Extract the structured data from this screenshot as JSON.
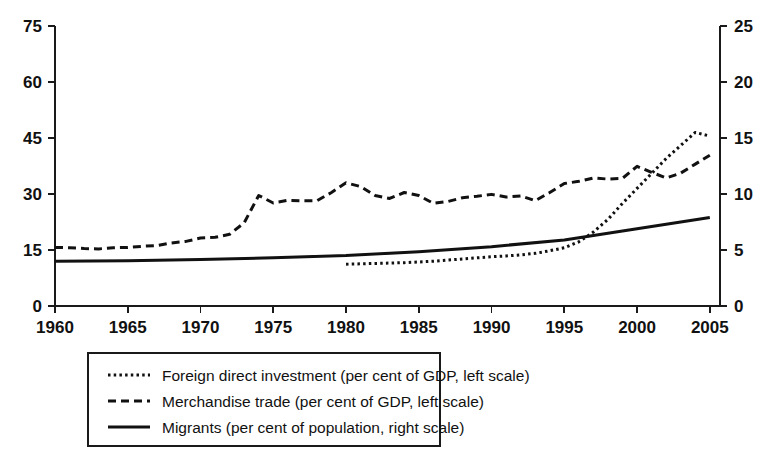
{
  "chart_data": {
    "type": "line",
    "title": "",
    "subtitle": "",
    "xlabel": "",
    "ylabel": "",
    "xlim": [
      1960,
      2005.7
    ],
    "ylim": [
      0,
      75
    ],
    "y2lim": [
      0,
      25
    ],
    "xticks": [
      1960,
      1965,
      1970,
      1975,
      1980,
      1985,
      1990,
      1995,
      2000,
      2005
    ],
    "xticklabels": [
      "1960",
      "1965",
      "1970",
      "1975",
      "1980",
      "1985",
      "1990",
      "1995",
      "2000",
      "2005"
    ],
    "yticks": [
      0,
      15,
      30,
      45,
      60,
      75
    ],
    "yticklabels": [
      "0",
      "15",
      "30",
      "45",
      "60",
      "75"
    ],
    "y2ticks": [
      0,
      5,
      10,
      15,
      20,
      25
    ],
    "y2ticklabels": [
      "0",
      "5",
      "10",
      "15",
      "20",
      "25"
    ],
    "grid": false,
    "legend_position": "below-center",
    "series": [
      {
        "name": "Foreign direct investment (per cent of GDP, left scale)",
        "style": "dotted",
        "axis": "left",
        "color": "#111111",
        "x": [
          1980,
          1981,
          1982,
          1983,
          1984,
          1985,
          1986,
          1987,
          1988,
          1989,
          1990,
          1991,
          1992,
          1993,
          1994,
          1995,
          1996,
          1997,
          1998,
          1999,
          2000,
          2001,
          2002,
          2003,
          2004,
          2005
        ],
        "values": [
          11.2,
          11.3,
          11.4,
          11.5,
          11.6,
          11.8,
          12.0,
          12.3,
          12.6,
          12.9,
          13.2,
          13.4,
          13.7,
          14.1,
          14.8,
          15.6,
          17.2,
          19.8,
          23.2,
          27.5,
          31.5,
          35.5,
          39.5,
          43.0,
          46.5,
          45.5
        ]
      },
      {
        "name": "Merchandise trade (per cent of GDP, left scale)",
        "style": "dashed",
        "axis": "left",
        "color": "#111111",
        "x": [
          1960,
          1961,
          1962,
          1963,
          1964,
          1965,
          1966,
          1967,
          1968,
          1969,
          1970,
          1971,
          1972,
          1973,
          1974,
          1975,
          1976,
          1977,
          1978,
          1979,
          1980,
          1981,
          1982,
          1983,
          1984,
          1985,
          1986,
          1987,
          1988,
          1989,
          1990,
          1991,
          1992,
          1993,
          1994,
          1995,
          1996,
          1997,
          1998,
          1999,
          2000,
          2001,
          2002,
          2003,
          2004,
          2005
        ],
        "values": [
          15.7,
          15.6,
          15.4,
          15.3,
          15.6,
          15.7,
          16.0,
          16.2,
          16.9,
          17.3,
          18.2,
          18.4,
          19.2,
          22.3,
          29.6,
          27.6,
          28.3,
          28.2,
          28.2,
          30.4,
          33.0,
          32.0,
          29.6,
          28.8,
          30.4,
          29.6,
          27.5,
          28.0,
          29.0,
          29.4,
          29.9,
          29.2,
          29.5,
          28.2,
          30.4,
          32.8,
          33.4,
          34.3,
          34.0,
          34.2,
          37.4,
          35.8,
          34.3,
          35.6,
          38.0,
          40.4
        ]
      },
      {
        "name": "Migrants (per cent of population, right scale)",
        "style": "solid",
        "axis": "right",
        "color": "#111111",
        "x": [
          1960,
          1965,
          1970,
          1975,
          1980,
          1985,
          1990,
          1995,
          2000,
          2005
        ],
        "values": [
          4.0,
          4.05,
          4.15,
          4.3,
          4.5,
          4.85,
          5.3,
          5.9,
          6.9,
          7.9
        ]
      }
    ]
  },
  "legend": {
    "items": [
      {
        "label": "Foreign direct investment (per cent of GDP, left scale)",
        "style": "dotted"
      },
      {
        "label": "Merchandise trade (per cent of GDP, left scale)",
        "style": "dashed"
      },
      {
        "label": "Migrants (per cent of population, right scale)",
        "style": "solid"
      }
    ]
  }
}
